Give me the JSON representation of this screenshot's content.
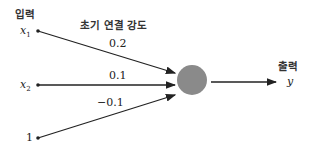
{
  "labels": {
    "input_title": "입력",
    "weights_title": "초기 연결 강도",
    "output_title": "출력"
  },
  "inputs": [
    {
      "symbol": "x",
      "subscript": "1",
      "weight": "0.2"
    },
    {
      "symbol": "x",
      "subscript": "2",
      "weight": "0.1"
    },
    {
      "symbol": "1",
      "subscript": "",
      "weight": "−0.1"
    }
  ],
  "output": {
    "symbol": "y"
  },
  "colors": {
    "neuron": "#8a8a8a",
    "line": "#222222"
  }
}
